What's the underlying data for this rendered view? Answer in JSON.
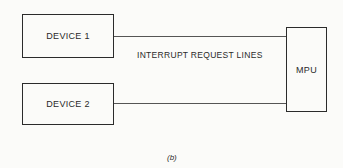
{
  "diagram": {
    "blocks": {
      "device1": "DEVICE 1",
      "device2": "DEVICE 2",
      "mpu": "MPU"
    },
    "connection_label": "INTERRUPT REQUEST LINES",
    "caption": "(b)"
  }
}
